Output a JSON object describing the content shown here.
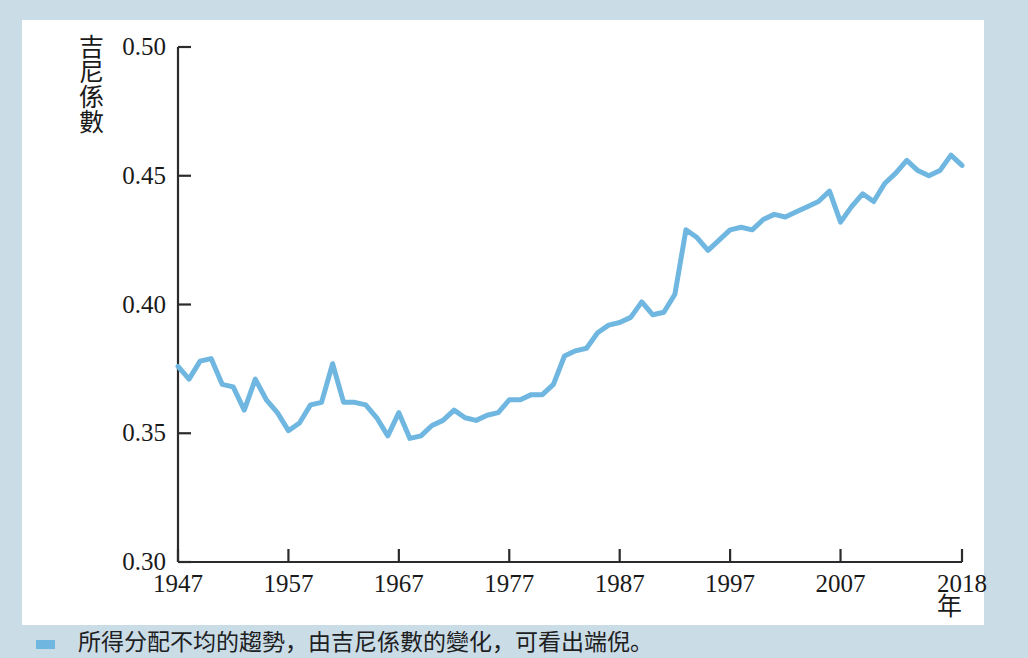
{
  "figure": {
    "frame_color": "#cadce6",
    "background": "#ffffff",
    "caption_text": "所得分配不均的趨勢，由吉尼係數的變化，可看出端倪。",
    "caption_marker_color": "#6fb7e0"
  },
  "chart_data": {
    "type": "line",
    "title": "",
    "xlabel": "年",
    "ylabel": "吉尼係數",
    "xlim": [
      1947,
      2018
    ],
    "ylim": [
      0.3,
      0.5
    ],
    "grid": false,
    "legend": "none",
    "line_color": "#6fb7e0",
    "axis_color": "#2b2b2b",
    "y_ticks": [
      "0.30",
      "0.35",
      "0.40",
      "0.45",
      "0.50"
    ],
    "y_tick_values": [
      0.3,
      0.35,
      0.4,
      0.45,
      0.5
    ],
    "x_ticks": [
      "1947",
      "1957",
      "1967",
      "1977",
      "1987",
      "1997",
      "2007",
      "2018"
    ],
    "x_tick_values": [
      1947,
      1957,
      1967,
      1977,
      1987,
      1997,
      2007,
      2018
    ],
    "x": [
      1947,
      1948,
      1949,
      1950,
      1951,
      1952,
      1953,
      1954,
      1955,
      1956,
      1957,
      1958,
      1959,
      1960,
      1961,
      1962,
      1963,
      1964,
      1965,
      1966,
      1967,
      1968,
      1969,
      1970,
      1971,
      1972,
      1973,
      1974,
      1975,
      1976,
      1977,
      1978,
      1979,
      1980,
      1981,
      1982,
      1983,
      1984,
      1985,
      1986,
      1987,
      1988,
      1989,
      1990,
      1991,
      1992,
      1993,
      1994,
      1995,
      1996,
      1997,
      1998,
      1999,
      2000,
      2001,
      2002,
      2003,
      2004,
      2005,
      2006,
      2007,
      2008,
      2009,
      2010,
      2011,
      2012,
      2013,
      2014,
      2015,
      2016,
      2017,
      2018
    ],
    "values": [
      0.376,
      0.371,
      0.378,
      0.379,
      0.369,
      0.368,
      0.359,
      0.371,
      0.363,
      0.358,
      0.351,
      0.354,
      0.361,
      0.362,
      0.377,
      0.362,
      0.362,
      0.361,
      0.356,
      0.349,
      0.358,
      0.348,
      0.349,
      0.353,
      0.355,
      0.359,
      0.356,
      0.355,
      0.357,
      0.358,
      0.363,
      0.363,
      0.365,
      0.365,
      0.369,
      0.38,
      0.382,
      0.383,
      0.389,
      0.392,
      0.393,
      0.395,
      0.401,
      0.396,
      0.397,
      0.404,
      0.429,
      0.426,
      0.421,
      0.425,
      0.429,
      0.43,
      0.429,
      0.433,
      0.435,
      0.434,
      0.436,
      0.438,
      0.44,
      0.444,
      0.432,
      0.438,
      0.443,
      0.44,
      0.447,
      0.451,
      0.456,
      0.452,
      0.45,
      0.452,
      0.458,
      0.454
    ],
    "series_name": "吉尼係數"
  }
}
